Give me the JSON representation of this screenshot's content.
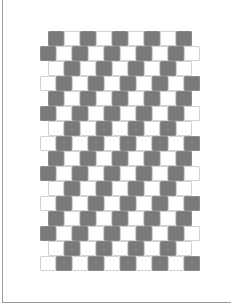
{
  "figure": {
    "name": "cafe-wall-illusion",
    "colors": {
      "dark": "#7a7a7a",
      "light": "#ffffff",
      "mortar": "#d2d2d2",
      "frame": "#9a9a9a"
    },
    "tile": {
      "width": 16,
      "height": 15
    },
    "grid_top": 31,
    "rows": [
      {
        "x": 48,
        "count": 9,
        "first": "dark"
      },
      {
        "x": 40,
        "count": 10,
        "first": "dark"
      },
      {
        "x": 48,
        "count": 9,
        "first": "light"
      },
      {
        "x": 40,
        "count": 10,
        "first": "light"
      },
      {
        "x": 48,
        "count": 9,
        "first": "dark"
      },
      {
        "x": 40,
        "count": 10,
        "first": "dark"
      },
      {
        "x": 48,
        "count": 9,
        "first": "light"
      },
      {
        "x": 40,
        "count": 10,
        "first": "light"
      },
      {
        "x": 48,
        "count": 9,
        "first": "dark"
      },
      {
        "x": 40,
        "count": 10,
        "first": "dark"
      },
      {
        "x": 48,
        "count": 9,
        "first": "light"
      },
      {
        "x": 40,
        "count": 10,
        "first": "light"
      },
      {
        "x": 48,
        "count": 9,
        "first": "dark"
      },
      {
        "x": 40,
        "count": 10,
        "first": "dark"
      },
      {
        "x": 48,
        "count": 9,
        "first": "light"
      },
      {
        "x": 40,
        "count": 10,
        "first": "light"
      }
    ]
  }
}
